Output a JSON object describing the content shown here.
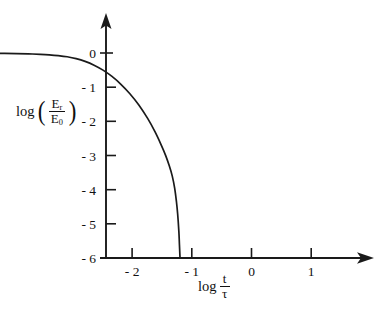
{
  "chart_data": {
    "type": "line",
    "title": "",
    "subtitle": "",
    "xlabel": "log t/τ",
    "ylabel": "log (E_r / E_0)",
    "xlabel_parts": {
      "log": "log",
      "numerator": "t",
      "denominator": "τ"
    },
    "ylabel_parts": {
      "log": "log",
      "open_paren": "(",
      "close_paren": ")",
      "numerator_base": "E",
      "numerator_sub": "r",
      "denominator_base": "E",
      "denominator_sub": "0"
    },
    "xticks": [
      -2,
      -1,
      0,
      1
    ],
    "xtick_labels": [
      "- 2",
      "- 1",
      "0",
      "1"
    ],
    "yticks": [
      0,
      -1,
      -2,
      -3,
      -4,
      -5,
      -6
    ],
    "ytick_labels": [
      "0",
      "- 1",
      "- 2",
      "- 3",
      "- 4",
      "- 5",
      "- 6"
    ],
    "xlim": [
      -2.47,
      2.02
    ],
    "ylim": [
      -6,
      0.42
    ],
    "grid": false,
    "legend": null,
    "axis_style": "arrowed-half-axes",
    "line_color": "#1a1a1a",
    "axis_color": "#1a1a1a",
    "background_color": "#ffffff",
    "series": [
      {
        "name": "relaxation modulus decay",
        "x": [
          -2.47,
          -2.3,
          -2.1,
          -1.9,
          -1.7,
          -1.5,
          -1.3,
          -1.1,
          -0.95,
          -0.8,
          -0.65,
          -0.5,
          -0.35,
          -0.2,
          -0.05,
          0.1,
          0.25,
          0.4,
          0.55,
          0.7,
          0.82,
          0.92,
          1.0,
          1.06,
          1.11,
          1.15,
          1.18,
          1.2,
          1.22,
          1.23,
          1.24
        ],
        "y": [
          -0.005,
          -0.006,
          -0.008,
          -0.01,
          -0.013,
          -0.018,
          -0.025,
          -0.038,
          -0.052,
          -0.075,
          -0.11,
          -0.165,
          -0.245,
          -0.355,
          -0.5,
          -0.685,
          -0.915,
          -1.19,
          -1.52,
          -1.92,
          -2.3,
          -2.67,
          -3.0,
          -3.3,
          -3.6,
          -3.95,
          -4.35,
          -4.7,
          -5.2,
          -5.6,
          -6.0
        ]
      }
    ]
  },
  "geometry": {
    "origin_x_px": 106,
    "baseline_y_px": 258,
    "px_per_x_decade": 59.7,
    "px_per_y_unit": 34.2,
    "y_zero_px": 53,
    "x_axis_end_px": 372,
    "y_axis_top_px": 15,
    "curve_end_x_px": 321
  }
}
